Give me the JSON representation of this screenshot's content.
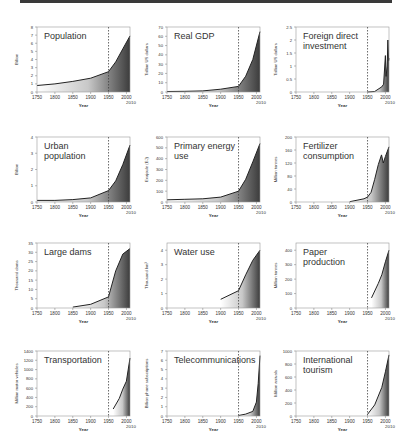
{
  "figure": {
    "xlabel": "Year",
    "x_ticks": [
      "1750",
      "1800",
      "1850",
      "1900",
      "1950",
      "2000"
    ],
    "x_end_label": "2010",
    "marker_year": 1950
  },
  "chart_data": [
    {
      "type": "area",
      "title": "Population",
      "ylabel": "Billion",
      "ylim": [
        0,
        8
      ],
      "yticks": [
        "0",
        "1",
        "2",
        "3",
        "4",
        "5",
        "6",
        "7",
        "8"
      ],
      "x": [
        1750,
        1800,
        1850,
        1900,
        1950,
        1970,
        1990,
        2010
      ],
      "values": [
        0.8,
        1.0,
        1.3,
        1.7,
        2.5,
        3.7,
        5.3,
        6.9
      ]
    },
    {
      "type": "area",
      "title": "Real GDP",
      "ylabel": "Trillion US dollars",
      "ylim": [
        0,
        70
      ],
      "yticks": [
        "0",
        "10",
        "20",
        "30",
        "40",
        "50",
        "60",
        "70"
      ],
      "x": [
        1750,
        1800,
        1850,
        1900,
        1950,
        1970,
        1990,
        2010
      ],
      "values": [
        0.5,
        0.7,
        1.2,
        3,
        6,
        17,
        35,
        65
      ]
    },
    {
      "type": "area",
      "title": "Foreign direct investment",
      "ylabel": "Trillion US dollars",
      "ylim": [
        0,
        2.5
      ],
      "yticks": [
        "0",
        "0.5",
        "1",
        "1.5",
        "2",
        "2.5"
      ],
      "x": [
        1950,
        1970,
        1990,
        1995,
        2000,
        2002,
        2005,
        2007,
        2009,
        2010
      ],
      "values": [
        0,
        0.02,
        0.2,
        0.3,
        1.4,
        0.6,
        1.0,
        2.0,
        1.2,
        1.3
      ]
    },
    {
      "type": "area",
      "title": "Urban population",
      "ylabel": "Billion",
      "ylim": [
        0,
        4
      ],
      "yticks": [
        "0",
        "1",
        "2",
        "3",
        "4"
      ],
      "x": [
        1750,
        1800,
        1850,
        1900,
        1950,
        1970,
        1990,
        2010
      ],
      "values": [
        0.1,
        0.1,
        0.15,
        0.25,
        0.7,
        1.3,
        2.3,
        3.5
      ]
    },
    {
      "type": "area",
      "title": "Primary energy use",
      "ylabel": "Exajoule (EJ)",
      "ylim": [
        0,
        600
      ],
      "yticks": [
        "0",
        "100",
        "200",
        "300",
        "400",
        "500",
        "600"
      ],
      "x": [
        1750,
        1800,
        1850,
        1900,
        1950,
        1970,
        1990,
        2010
      ],
      "values": [
        20,
        25,
        30,
        45,
        100,
        210,
        370,
        540
      ]
    },
    {
      "type": "area",
      "title": "Fertilizer consumption",
      "ylabel": "Million tonnes",
      "ylim": [
        0,
        200
      ],
      "yticks": [
        "0",
        "40",
        "80",
        "120",
        "160",
        "200"
      ],
      "x": [
        1900,
        1940,
        1950,
        1960,
        1970,
        1980,
        1989,
        1994,
        2000,
        2010
      ],
      "values": [
        1,
        10,
        15,
        30,
        70,
        115,
        145,
        120,
        140,
        170
      ]
    },
    {
      "type": "area",
      "title": "Large dams",
      "ylabel": "Thousand dams",
      "ylim": [
        0,
        35
      ],
      "yticks": [
        "0",
        "5",
        "10",
        "15",
        "20",
        "25",
        "30",
        "35"
      ],
      "x": [
        1850,
        1900,
        1950,
        1970,
        1990,
        2010
      ],
      "values": [
        0.5,
        2,
        6,
        20,
        29,
        32
      ]
    },
    {
      "type": "area",
      "title": "Water use",
      "ylabel": "Thousand km³",
      "ylim": [
        0,
        4.5
      ],
      "yticks": [
        "0",
        "1",
        "2",
        "3",
        "4"
      ],
      "x": [
        1900,
        1950,
        1970,
        1990,
        2010
      ],
      "values": [
        0.6,
        1.2,
        2.3,
        3.3,
        4.0
      ]
    },
    {
      "type": "area",
      "title": "Paper production",
      "ylabel": "Million tonnes",
      "ylim": [
        0,
        450
      ],
      "yticks": [
        "0",
        "100",
        "200",
        "300",
        "400"
      ],
      "x": [
        1961,
        1980,
        1990,
        2000,
        2010
      ],
      "values": [
        70,
        170,
        230,
        320,
        400
      ]
    },
    {
      "type": "area",
      "title": "Transportation",
      "ylabel": "Million motor vehicles",
      "ylim": [
        0,
        1400
      ],
      "yticks": [
        "0",
        "200",
        "400",
        "600",
        "800",
        "1000",
        "1200",
        "1400"
      ],
      "x": [
        1963,
        1980,
        1990,
        2000,
        2010
      ],
      "values": [
        150,
        380,
        580,
        750,
        1250
      ]
    },
    {
      "type": "area",
      "title": "Telecommunications",
      "ylabel": "Billion phone subscriptions",
      "ylim": [
        0,
        7
      ],
      "yticks": [
        "0",
        "1",
        "2",
        "3",
        "4",
        "5",
        "6",
        "7"
      ],
      "x": [
        1950,
        1970,
        1990,
        2000,
        2005,
        2010
      ],
      "values": [
        0.05,
        0.2,
        0.5,
        1.5,
        3.5,
        6.5
      ]
    },
    {
      "type": "area",
      "title": "International tourism",
      "ylabel": "Million arrivals",
      "ylim": [
        0,
        1000
      ],
      "yticks": [
        "0",
        "200",
        "400",
        "600",
        "800",
        "1000"
      ],
      "x": [
        1950,
        1970,
        1990,
        2000,
        2010
      ],
      "values": [
        25,
        170,
        440,
        680,
        940
      ]
    }
  ]
}
